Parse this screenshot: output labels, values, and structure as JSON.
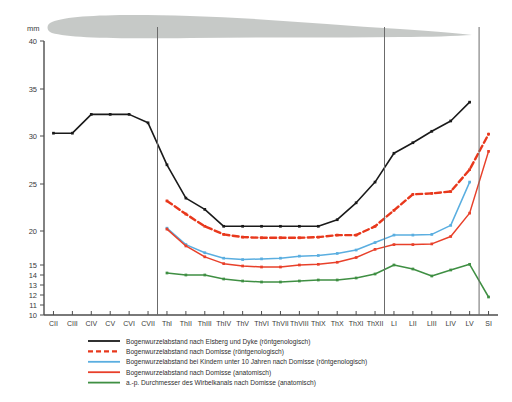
{
  "figure": {
    "unit_label": "mm",
    "background_shape_name": "spinal-canal-silhouette",
    "background_shape_color": "#c3c6c4"
  },
  "axes": {
    "y_ticks": [
      40,
      35,
      30,
      25,
      20,
      15,
      14,
      13,
      12,
      11,
      10
    ],
    "y_tick_labels": [
      "40",
      "35",
      "30",
      "25",
      "20",
      "15",
      "14",
      "13",
      "12",
      "11",
      "10"
    ],
    "y_label": "mm",
    "x_categories": [
      "CII",
      "CIII",
      "CIV",
      "CV",
      "CVI",
      "CVII",
      "ThI",
      "ThII",
      "ThIII",
      "ThIV",
      "ThV",
      "ThVI",
      "ThVII",
      "ThVIII",
      "ThIX",
      "ThX",
      "ThXI",
      "ThXII",
      "LI",
      "LII",
      "LIII",
      "LIV",
      "LV",
      "SI"
    ],
    "dividers_after": [
      "CVII",
      "ThXII",
      "LV"
    ],
    "grid": false
  },
  "colors": {
    "black": "#1a1a1a",
    "red_dashed": "#e8381c",
    "light_blue": "#5aaee0",
    "red_solid": "#e8402a",
    "green": "#3f8f43",
    "axis": "#4d4d4d",
    "divider": "#6b6b6b"
  },
  "legend": {
    "position": "below-axis",
    "items": [
      {
        "label": "Bogenwurzelabstand nach Elsberg und Dyke (röntgenologisch)",
        "color": "#1a1a1a",
        "style": "solid",
        "swatch_name": "legend-swatch-elsberg-dyke"
      },
      {
        "label": "Bogenwurzelabstand nach Domisse (röntgenologisch)",
        "color": "#e8381c",
        "style": "dashed",
        "swatch_name": "legend-swatch-domisse-roentgen"
      },
      {
        "label": "Bogenwurzelabstand bei Kindern unter 10 Jahren nach Domisse (röntgenologisch)",
        "color": "#5aaee0",
        "style": "solid",
        "swatch_name": "legend-swatch-domisse-kinder"
      },
      {
        "label": "Bogenwurzelabstand nach Domisse  (anatomisch)",
        "color": "#e8402a",
        "style": "solid",
        "swatch_name": "legend-swatch-domisse-anatomisch"
      },
      {
        "label": "a.-p. Durchmesser des Wirbelkanals nach Domisse (anatomisch)",
        "color": "#3f8f43",
        "style": "solid",
        "swatch_name": "legend-swatch-wirbelkanal"
      }
    ]
  },
  "chart_data": {
    "type": "line",
    "title": "",
    "xlabel": "",
    "ylabel": "mm",
    "ylim": [
      10,
      40
    ],
    "y_scale_note": "non-linear: 40-15 linear, 15-10 compressed",
    "categories": [
      "CII",
      "CIII",
      "CIV",
      "CV",
      "CVI",
      "CVII",
      "ThI",
      "ThII",
      "ThIII",
      "ThIV",
      "ThV",
      "ThVI",
      "ThVII",
      "ThVIII",
      "ThIX",
      "ThX",
      "ThXI",
      "ThXII",
      "LI",
      "LII",
      "LIII",
      "LIV",
      "LV",
      "SI"
    ],
    "series": [
      {
        "name": "Bogenwurzelabstand nach Elsberg und Dyke (röntgenologisch)",
        "color": "#1a1a1a",
        "style": "solid",
        "values": [
          30.3,
          30.3,
          32.3,
          32.3,
          32.3,
          31.4,
          27.0,
          23.5,
          22.3,
          20.5,
          20.5,
          20.5,
          20.5,
          20.5,
          20.5,
          21.2,
          23.0,
          25.2,
          28.2,
          29.3,
          30.5,
          31.6,
          33.6,
          null
        ]
      },
      {
        "name": "Bogenwurzelabstand nach Domisse (röntgenologisch)",
        "color": "#e8381c",
        "style": "dashed",
        "values": [
          null,
          null,
          null,
          null,
          null,
          null,
          23.2,
          21.8,
          20.5,
          19.5,
          19.1,
          19.0,
          19.0,
          19.0,
          19.1,
          19.4,
          19.4,
          20.5,
          22.2,
          23.9,
          24.0,
          24.2,
          26.5,
          30.2
        ]
      },
      {
        "name": "Bogenwurzelabstand bei Kindern unter 10 Jahren nach Domisse (röntgenologisch)",
        "color": "#5aaee0",
        "style": "solid",
        "values": [
          null,
          null,
          null,
          null,
          null,
          null,
          20.3,
          18.0,
          16.8,
          16.0,
          15.8,
          15.9,
          16.0,
          16.3,
          16.4,
          16.7,
          17.2,
          18.3,
          19.4,
          19.4,
          19.5,
          20.6,
          25.2,
          null
        ]
      },
      {
        "name": "Bogenwurzelabstand nach Domisse  (anatomisch)",
        "color": "#e8402a",
        "style": "solid",
        "values": [
          null,
          null,
          null,
          null,
          null,
          null,
          20.2,
          17.8,
          16.2,
          15.2,
          14.9,
          14.8,
          14.8,
          15.0,
          15.1,
          15.4,
          16.1,
          17.3,
          18.0,
          18.0,
          18.1,
          19.2,
          21.9,
          28.4
        ]
      },
      {
        "name": "a.-p. Durchmesser des Wirbelkanals nach Domisse (anatomisch)",
        "color": "#3f8f43",
        "style": "solid",
        "values": [
          null,
          null,
          null,
          null,
          null,
          null,
          14.2,
          14.0,
          14.0,
          13.6,
          13.4,
          13.3,
          13.3,
          13.4,
          13.5,
          13.5,
          13.7,
          14.1,
          15.0,
          14.6,
          13.9,
          14.5,
          15.1,
          11.8
        ]
      }
    ]
  }
}
